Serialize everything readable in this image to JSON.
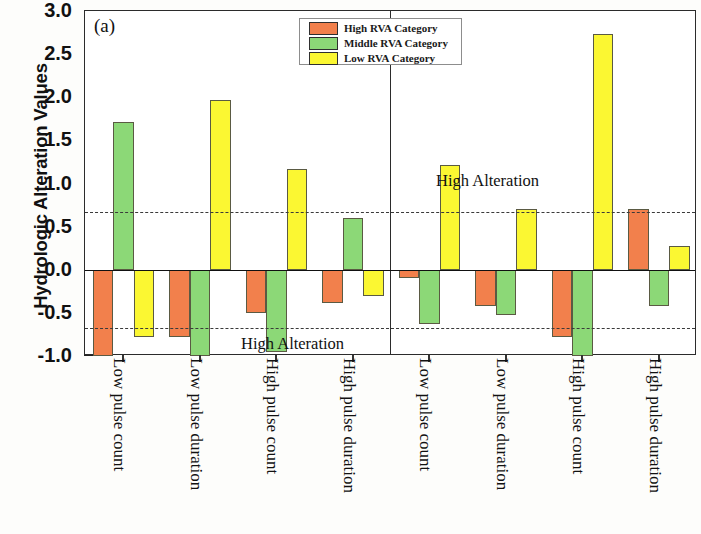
{
  "figure": {
    "ylabel": "Hydrologic Alteration Values",
    "panel_a_label": "(a)",
    "panel_b_label": "(b)",
    "annotation": "High Alteration"
  },
  "legend": {
    "items": [
      {
        "label": "High RVA Category",
        "color": "#F2804C"
      },
      {
        "label": "Middle RVA Category",
        "color": "#8CD877"
      },
      {
        "label": "Low RVA Category",
        "color": "#FBF732"
      }
    ]
  },
  "axis": {
    "y_ticks": [
      "3.0",
      "2.5",
      "2.0",
      "1.5",
      "1.0",
      "0.5",
      "0.0",
      "-0.5",
      "-1.0"
    ],
    "y_min": -1.0,
    "y_max": 3.0,
    "threshold_upper": 0.67,
    "threshold_lower": -0.67
  },
  "chart_data": {
    "type": "bar",
    "title": "",
    "xlabel": "",
    "ylabel": "Hydrologic Alteration Values",
    "ylim": [
      -1.0,
      3.0
    ],
    "grid": false,
    "legend_position": "top-center",
    "annotations": [
      {
        "text": "High Alteration",
        "panel": "a",
        "x_value": "High pulse count",
        "y_value": -0.85
      },
      {
        "text": "High Alteration",
        "panel": "b",
        "x_value": "Low pulse duration",
        "y_value": 0.95
      }
    ],
    "threshold_lines": [
      0.67,
      -0.67
    ],
    "panels": [
      {
        "label": "(a)",
        "categories": [
          "Low pulse count",
          "Low pulse duration",
          "High pulse count",
          "High pulse duration"
        ],
        "series": [
          {
            "name": "High RVA Category",
            "color": "#F2804C",
            "values": [
              -1.0,
              -0.78,
              -0.5,
              -0.38
            ]
          },
          {
            "name": "Middle RVA Category",
            "color": "#8CD877",
            "values": [
              1.71,
              -1.0,
              -0.95,
              0.6
            ]
          },
          {
            "name": "Low RVA Category",
            "color": "#FBF732",
            "values": [
              -0.78,
              1.97,
              1.17,
              -0.3
            ]
          }
        ]
      },
      {
        "label": "(b)",
        "categories": [
          "Low pulse count",
          "Low pulse duration",
          "High pulse count",
          "High pulse duration"
        ],
        "series": [
          {
            "name": "High RVA Category",
            "color": "#F2804C",
            "values": [
              -0.1,
              -0.42,
              -0.78,
              0.7
            ]
          },
          {
            "name": "Middle RVA Category",
            "color": "#8CD877",
            "values": [
              -0.63,
              -0.52,
              -1.0,
              -0.42
            ]
          },
          {
            "name": "Low RVA Category",
            "color": "#FBF732",
            "values": [
              1.22,
              0.7,
              2.73,
              0.28
            ]
          }
        ]
      }
    ]
  }
}
